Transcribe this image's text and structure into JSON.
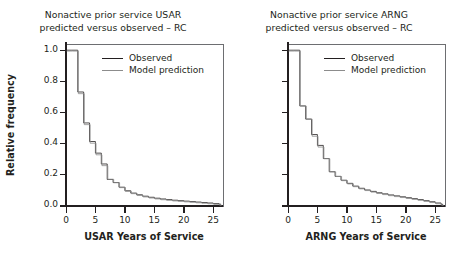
{
  "figure": {
    "width": 453,
    "height": 262,
    "background": "#ffffff",
    "ink_color": "#231f20",
    "frame_color": "#6d6e71"
  },
  "panels": [
    {
      "id": "usar",
      "title": "Nonactive prior service USAR\npredicted versus observed – RC",
      "ylabel": "Relative frequency",
      "xlabel": "USAR Years of Service",
      "legend": {
        "observed_label": "Observed",
        "model_label": "Model prediction",
        "observed_color": "#231f20",
        "model_color": "#8c8c8c"
      }
    },
    {
      "id": "arng",
      "title": "Nonactive prior service ARNG\npredicted versus observed – RC",
      "ylabel": "",
      "xlabel": "ARNG Years of Service",
      "legend": {
        "observed_label": "Observed",
        "model_label": "Model prediction",
        "observed_color": "#231f20",
        "model_color": "#8c8c8c"
      }
    }
  ],
  "chart_data": [
    {
      "type": "line",
      "id": "usar",
      "title": "Nonactive prior service USAR predicted versus observed – RC",
      "xlabel": "USAR Years of Service",
      "ylabel": "Relative frequency",
      "xlim": [
        0,
        26.5
      ],
      "ylim": [
        0.0,
        1.04
      ],
      "xticks": [
        0,
        5,
        10,
        15,
        20,
        25
      ],
      "xticklabels": [
        "0",
        "5",
        "10",
        "15",
        "20",
        "25"
      ],
      "yticks": [
        0.0,
        0.2,
        0.4,
        0.6,
        0.8,
        1.0
      ],
      "yticklabels": [
        "0.0",
        "0.2",
        "0.4",
        "0.6",
        "0.8",
        "1.0"
      ],
      "grid": false,
      "legend_position": "top-right",
      "drawstyle": "steps-post",
      "x": [
        0,
        1,
        2,
        3,
        4,
        5,
        6,
        7,
        8,
        9,
        10,
        11,
        12,
        13,
        14,
        15,
        16,
        17,
        18,
        19,
        20,
        21,
        22,
        23,
        24,
        25,
        26
      ],
      "series": [
        {
          "name": "Observed",
          "color": "#231f20",
          "values": [
            1.0,
            1.0,
            0.73,
            0.53,
            0.41,
            0.335,
            0.265,
            0.165,
            0.145,
            0.115,
            0.092,
            0.077,
            0.066,
            0.057,
            0.05,
            0.044,
            0.039,
            0.035,
            0.031,
            0.028,
            0.025,
            0.022,
            0.019,
            0.016,
            0.013,
            0.009,
            0.005
          ]
        },
        {
          "name": "Model prediction",
          "color": "#8c8c8c",
          "values": [
            1.0,
            1.0,
            0.725,
            0.525,
            0.405,
            0.33,
            0.26,
            0.172,
            0.15,
            0.118,
            0.094,
            0.079,
            0.067,
            0.058,
            0.051,
            0.045,
            0.04,
            0.036,
            0.032,
            0.029,
            0.026,
            0.023,
            0.02,
            0.017,
            0.014,
            0.01,
            0.005
          ]
        }
      ]
    },
    {
      "type": "line",
      "id": "arng",
      "title": "Nonactive prior service ARNG predicted versus observed – RC",
      "xlabel": "ARNG Years of Service",
      "ylabel": "Relative frequency",
      "xlim": [
        0,
        26.5
      ],
      "ylim": [
        0.0,
        1.04
      ],
      "xticks": [
        0,
        5,
        10,
        15,
        20,
        25
      ],
      "xticklabels": [
        "0",
        "5",
        "10",
        "15",
        "20",
        "25"
      ],
      "yticks": [
        0.0,
        0.2,
        0.4,
        0.6,
        0.8,
        1.0
      ],
      "yticklabels": [
        "",
        "",
        "",
        "",
        "",
        ""
      ],
      "grid": false,
      "legend_position": "top-right",
      "drawstyle": "steps-post",
      "x": [
        0,
        1,
        2,
        3,
        4,
        5,
        6,
        7,
        8,
        9,
        10,
        11,
        12,
        13,
        14,
        15,
        16,
        17,
        18,
        19,
        20,
        21,
        22,
        23,
        24,
        25,
        26
      ],
      "series": [
        {
          "name": "Observed",
          "color": "#231f20",
          "values": [
            1.0,
            1.0,
            0.64,
            0.555,
            0.455,
            0.385,
            0.3,
            0.215,
            0.185,
            0.16,
            0.14,
            0.122,
            0.108,
            0.097,
            0.088,
            0.079,
            0.072,
            0.065,
            0.059,
            0.053,
            0.047,
            0.041,
            0.035,
            0.028,
            0.021,
            0.013,
            0.004
          ]
        },
        {
          "name": "Model prediction",
          "color": "#8c8c8c",
          "values": [
            1.0,
            1.0,
            0.645,
            0.56,
            0.45,
            0.38,
            0.305,
            0.22,
            0.19,
            0.163,
            0.142,
            0.124,
            0.11,
            0.099,
            0.089,
            0.08,
            0.073,
            0.066,
            0.06,
            0.054,
            0.048,
            0.042,
            0.036,
            0.029,
            0.022,
            0.014,
            0.004
          ]
        }
      ]
    }
  ]
}
